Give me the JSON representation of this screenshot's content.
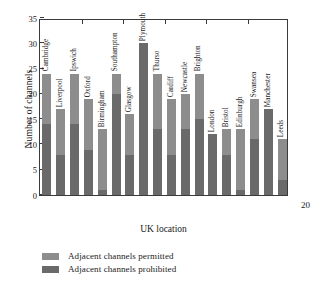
{
  "chart_data": {
    "type": "bar",
    "subtype": "stacked-vertical",
    "title": "",
    "xlabel": "UK location",
    "ylabel": "Number of channels",
    "ylim": [
      0,
      35
    ],
    "yticks": [
      0,
      5,
      10,
      15,
      20,
      25,
      30,
      35
    ],
    "grid": false,
    "legend_position": "below-plot-left",
    "categories": [
      "Cambridge",
      "Liverpool",
      "Ipswich",
      "Oxford",
      "Birmingham",
      "Southampton",
      "Glasgow",
      "Plymouth",
      "Thurso",
      "Cardiff",
      "Newcastle",
      "Brighton",
      "London",
      "Bristol",
      "Edinburgh",
      "Swansea",
      "Manchester",
      "Leeds"
    ],
    "series": [
      {
        "name": "Adjacent channels permitted",
        "color": "#8d8d8d",
        "note": "light segment is the upper portion of each stacked bar; bar top = total",
        "values": [
          10,
          9,
          10,
          10,
          12,
          4,
          8,
          0,
          11,
          11,
          7,
          9,
          0,
          5,
          12,
          8,
          0,
          8
        ]
      },
      {
        "name": "Adjacent channels prohibited",
        "color": "#6a6a6a",
        "note": "dark segment measured from zero baseline",
        "values": [
          14,
          8,
          14,
          9,
          1,
          20,
          8,
          30,
          13,
          8,
          13,
          15,
          12,
          8,
          1,
          11,
          17,
          3
        ]
      }
    ],
    "totals": [
      24,
      17,
      24,
      19,
      13,
      24,
      16,
      30,
      24,
      19,
      20,
      24,
      12,
      13,
      13,
      19,
      17,
      11
    ]
  },
  "axes": {
    "y_title": "Number of channels",
    "x_title": "UK location",
    "y_tick_labels": [
      "35",
      "30",
      "25",
      "20",
      "15",
      "10",
      "5",
      "0"
    ]
  },
  "legend": {
    "items": [
      {
        "label": "Adjacent channels permitted",
        "color": "#8d8d8d"
      },
      {
        "label": "Adjacent channels prohibited",
        "color": "#6a6a6a"
      }
    ]
  },
  "page_number": "20"
}
